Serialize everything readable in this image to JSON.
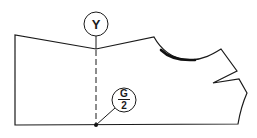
{
  "diagram": {
    "type": "sewing-pattern-piece",
    "labels": {
      "top_marker": "Y",
      "bottom_marker_numerator": "G",
      "bottom_marker_denominator": "2"
    },
    "colors": {
      "line": "#1a1a1a",
      "background": "#ffffff"
    }
  }
}
